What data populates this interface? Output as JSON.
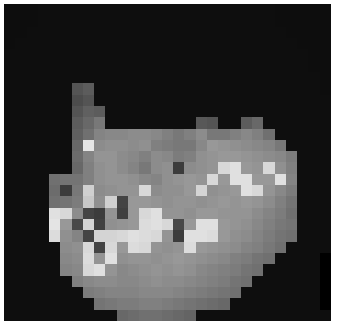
{
  "image": {
    "kind": "pixelated-grayscale-raster",
    "alt_description": "Heavily pixelated low-resolution grayscale photograph of a human face on a black background",
    "canvas_width": 341,
    "canvas_height": 328,
    "background_color": "#ffffff",
    "frame": {
      "x": 4,
      "y": 4,
      "width": 327,
      "height": 317
    },
    "frame_background_color": "#0d0d0d",
    "grid": {
      "columns": 29,
      "rows": 28,
      "cell_size_px": 11
    },
    "value_range": [
      0,
      255
    ],
    "colormap": "grayscale",
    "darkest_value": 10,
    "brightest_value": 238
  },
  "chart_data": {
    "type": "heatmap",
    "title": "",
    "xlabel": "",
    "ylabel": "",
    "colormap": "gray",
    "vmin": 0,
    "vmax": 255,
    "grid": false,
    "legend": "none",
    "columns": 29,
    "rows": 28,
    "values": [
      [
        13,
        13,
        13,
        14,
        14,
        14,
        14,
        14,
        14,
        14,
        14,
        14,
        14,
        14,
        14,
        14,
        14,
        14,
        14,
        14,
        14,
        14,
        14,
        14,
        13,
        13,
        13,
        13,
        13
      ],
      [
        13,
        13,
        13,
        14,
        14,
        14,
        14,
        14,
        14,
        14,
        14,
        14,
        14,
        14,
        14,
        14,
        14,
        14,
        14,
        14,
        14,
        14,
        14,
        14,
        13,
        13,
        13,
        13,
        13
      ],
      [
        13,
        13,
        14,
        14,
        14,
        14,
        14,
        14,
        14,
        14,
        14,
        14,
        14,
        14,
        14,
        14,
        14,
        14,
        14,
        14,
        14,
        14,
        14,
        14,
        14,
        13,
        13,
        13,
        13
      ],
      [
        13,
        14,
        14,
        14,
        14,
        14,
        14,
        14,
        14,
        14,
        14,
        14,
        14,
        14,
        14,
        14,
        14,
        14,
        14,
        14,
        14,
        14,
        14,
        14,
        14,
        14,
        13,
        13,
        13
      ],
      [
        14,
        14,
        14,
        14,
        14,
        14,
        14,
        14,
        14,
        14,
        14,
        14,
        14,
        14,
        14,
        14,
        14,
        14,
        14,
        14,
        14,
        14,
        14,
        14,
        14,
        14,
        14,
        13,
        13
      ],
      [
        14,
        14,
        14,
        14,
        14,
        14,
        14,
        14,
        14,
        14,
        14,
        14,
        14,
        14,
        14,
        14,
        14,
        14,
        14,
        14,
        14,
        14,
        14,
        14,
        14,
        14,
        14,
        13,
        13
      ],
      [
        14,
        14,
        14,
        14,
        14,
        14,
        14,
        14,
        14,
        14,
        14,
        14,
        14,
        14,
        14,
        14,
        14,
        14,
        14,
        14,
        14,
        14,
        14,
        14,
        14,
        14,
        14,
        14,
        13
      ],
      [
        14,
        14,
        14,
        14,
        14,
        14,
        84,
        92,
        14,
        14,
        14,
        14,
        14,
        14,
        14,
        14,
        14,
        14,
        14,
        14,
        14,
        14,
        14,
        14,
        14,
        14,
        14,
        14,
        13
      ],
      [
        14,
        14,
        14,
        14,
        14,
        14,
        76,
        84,
        14,
        14,
        14,
        14,
        14,
        14,
        14,
        14,
        14,
        14,
        14,
        14,
        14,
        14,
        14,
        14,
        14,
        14,
        14,
        14,
        14
      ],
      [
        14,
        14,
        14,
        14,
        14,
        14,
        84,
        96,
        92,
        14,
        14,
        14,
        14,
        14,
        14,
        14,
        14,
        14,
        14,
        14,
        14,
        14,
        14,
        14,
        14,
        14,
        14,
        14,
        14
      ],
      [
        14,
        14,
        14,
        14,
        14,
        14,
        92,
        104,
        120,
        14,
        14,
        14,
        14,
        14,
        14,
        14,
        14,
        88,
        84,
        14,
        14,
        92,
        104,
        14,
        14,
        14,
        14,
        14,
        14
      ],
      [
        14,
        14,
        14,
        14,
        14,
        14,
        96,
        112,
        132,
        136,
        136,
        140,
        140,
        136,
        128,
        120,
        128,
        140,
        120,
        120,
        128,
        136,
        128,
        112,
        14,
        14,
        14,
        14,
        14
      ],
      [
        14,
        14,
        14,
        14,
        14,
        14,
        104,
        230,
        140,
        144,
        144,
        140,
        144,
        128,
        124,
        120,
        120,
        136,
        152,
        148,
        144,
        140,
        136,
        132,
        120,
        14,
        14,
        14,
        14
      ],
      [
        14,
        14,
        14,
        14,
        14,
        14,
        108,
        132,
        148,
        148,
        140,
        136,
        128,
        140,
        136,
        124,
        128,
        144,
        148,
        152,
        152,
        148,
        144,
        140,
        136,
        124,
        14,
        14,
        14
      ],
      [
        14,
        14,
        14,
        14,
        14,
        14,
        104,
        128,
        144,
        148,
        140,
        132,
        120,
        140,
        144,
        60,
        140,
        144,
        148,
        216,
        224,
        152,
        148,
        216,
        144,
        128,
        14,
        14,
        14
      ],
      [
        14,
        14,
        14,
        14,
        112,
        116,
        116,
        128,
        144,
        148,
        148,
        144,
        136,
        132,
        144,
        148,
        152,
        148,
        216,
        152,
        224,
        224,
        152,
        152,
        224,
        132,
        14,
        14,
        14
      ],
      [
        14,
        14,
        14,
        14,
        108,
        60,
        120,
        208,
        140,
        144,
        148,
        148,
        216,
        140,
        144,
        144,
        152,
        212,
        144,
        148,
        152,
        224,
        216,
        148,
        136,
        124,
        14,
        14,
        14
      ],
      [
        14,
        14,
        14,
        14,
        112,
        116,
        124,
        200,
        144,
        208,
        68,
        152,
        152,
        148,
        144,
        148,
        148,
        144,
        148,
        152,
        148,
        152,
        148,
        140,
        128,
        116,
        14,
        14,
        14
      ],
      [
        14,
        14,
        14,
        14,
        224,
        216,
        140,
        68,
        60,
        148,
        64,
        152,
        216,
        224,
        148,
        148,
        144,
        152,
        152,
        148,
        148,
        148,
        140,
        132,
        124,
        112,
        14,
        14,
        14
      ],
      [
        14,
        14,
        14,
        14,
        228,
        152,
        72,
        212,
        64,
        144,
        148,
        152,
        220,
        224,
        216,
        72,
        152,
        224,
        224,
        152,
        148,
        144,
        136,
        128,
        120,
        116,
        14,
        14,
        14
      ],
      [
        14,
        14,
        14,
        14,
        220,
        144,
        132,
        68,
        212,
        212,
        216,
        224,
        220,
        216,
        148,
        60,
        224,
        224,
        220,
        152,
        144,
        140,
        132,
        124,
        116,
        112,
        14,
        14,
        14
      ],
      [
        14,
        14,
        14,
        14,
        14,
        140,
        144,
        216,
        68,
        216,
        152,
        220,
        216,
        148,
        144,
        148,
        220,
        152,
        148,
        144,
        140,
        132,
        128,
        120,
        112,
        14,
        14,
        14,
        14
      ],
      [
        14,
        14,
        14,
        14,
        14,
        136,
        140,
        220,
        148,
        224,
        144,
        148,
        148,
        144,
        148,
        152,
        148,
        144,
        140,
        136,
        128,
        124,
        116,
        112,
        14,
        14,
        14,
        14
      ],
      [
        14,
        14,
        14,
        14,
        14,
        132,
        136,
        216,
        224,
        148,
        136,
        140,
        144,
        148,
        144,
        148,
        144,
        136,
        132,
        128,
        124,
        116,
        112,
        14,
        14,
        14,
        14,
        14
      ],
      [
        14,
        14,
        14,
        14,
        14,
        14,
        128,
        136,
        140,
        140,
        136,
        136,
        140,
        144,
        140,
        140,
        136,
        132,
        128,
        124,
        116,
        112,
        14,
        14,
        14,
        14,
        14,
        14
      ],
      [
        14,
        14,
        14,
        14,
        14,
        14,
        14,
        124,
        128,
        132,
        132,
        132,
        136,
        136,
        136,
        132,
        128,
        124,
        120,
        116,
        112,
        14,
        14,
        14,
        14,
        14,
        14,
        14
      ],
      [
        14,
        14,
        14,
        14,
        14,
        14,
        14,
        14,
        116,
        120,
        124,
        124,
        128,
        128,
        124,
        120,
        116,
        112,
        108,
        104,
        14,
        14,
        14,
        14,
        14,
        14,
        14,
        14
      ],
      [
        14,
        14,
        14,
        14,
        14,
        14,
        14,
        14,
        14,
        14,
        104,
        108,
        112,
        112,
        108,
        104,
        100,
        14,
        14,
        14,
        14,
        14,
        14,
        14,
        14,
        14,
        14,
        14,
        14
      ]
    ]
  }
}
